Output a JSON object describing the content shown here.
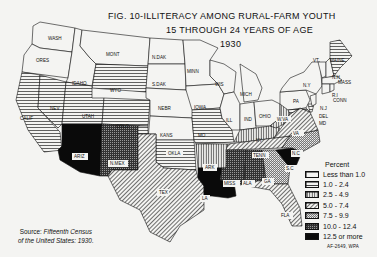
{
  "title": {
    "line1": "FIG. 10-ILLITERACY AMONG RURAL-FARM YOUTH",
    "line2": "15 THROUGH 24 YEARS OF AGE",
    "line3": "1930"
  },
  "legend": {
    "header": "Percent",
    "items": [
      {
        "label": "Less than 1.0",
        "pattern": "blank"
      },
      {
        "label": "1.0 - 2.4",
        "pattern": "horizontal"
      },
      {
        "label": "2.5 - 4.9",
        "pattern": "vertical"
      },
      {
        "label": "5.0 - 7.4",
        "pattern": "diagonal"
      },
      {
        "label": "7.5 - 9.9",
        "pattern": "crosshatch-light"
      },
      {
        "label": "10.0 - 12.4",
        "pattern": "crosshatch-dark"
      },
      {
        "label": "12.5 or more",
        "pattern": "solid"
      }
    ]
  },
  "source": {
    "prefix": "Source:",
    "text1": "Fifteenth Census",
    "text2": "of the United States: 1930."
  },
  "code": "AF-2649, WPA",
  "states": [
    {
      "abbr": "WASH",
      "class": "Less than 1.0"
    },
    {
      "abbr": "ORES",
      "class": "Less than 1.0"
    },
    {
      "abbr": "IDAHO",
      "class": "Less than 1.0"
    },
    {
      "abbr": "MONT",
      "class": "Less than 1.0"
    },
    {
      "abbr": "WYO",
      "class": "1.0 - 2.4"
    },
    {
      "abbr": "CALIF",
      "class": "1.0 - 2.4"
    },
    {
      "abbr": "NEV",
      "class": "1.0 - 2.4"
    },
    {
      "abbr": "UTAH",
      "class": "1.0 - 2.4"
    },
    {
      "abbr": "COLO",
      "class": "1.0 - 2.4"
    },
    {
      "abbr": "ARIZ",
      "class": "12.5 or more"
    },
    {
      "abbr": "N.MEX",
      "class": "10.0 - 12.4"
    },
    {
      "abbr": "N.DAK",
      "class": "Less than 1.0"
    },
    {
      "abbr": "S.DAK",
      "class": "Less than 1.0"
    },
    {
      "abbr": "NEBR",
      "class": "Less than 1.0"
    },
    {
      "abbr": "KANS",
      "class": "Less than 1.0"
    },
    {
      "abbr": "OKLA",
      "class": "1.0 - 2.4"
    },
    {
      "abbr": "TEX",
      "class": "5.0 - 7.4"
    },
    {
      "abbr": "MINN",
      "class": "Less than 1.0"
    },
    {
      "abbr": "IOWA",
      "class": "Less than 1.0"
    },
    {
      "abbr": "MO",
      "class": "1.0 - 2.4"
    },
    {
      "abbr": "ARK",
      "class": "2.5 - 4.9"
    },
    {
      "abbr": "LA",
      "class": "12.5 or more"
    },
    {
      "abbr": "WIS",
      "class": "Less than 1.0"
    },
    {
      "abbr": "ILL",
      "class": "Less than 1.0"
    },
    {
      "abbr": "MICH",
      "class": "Less than 1.0"
    },
    {
      "abbr": "IND",
      "class": "Less than 1.0"
    },
    {
      "abbr": "OHIO",
      "class": "Less than 1.0"
    },
    {
      "abbr": "KY",
      "class": "2.5 - 4.9"
    },
    {
      "abbr": "TENN",
      "class": "5.0 - 7.4"
    },
    {
      "abbr": "MISS",
      "class": "10.0 - 12.4"
    },
    {
      "abbr": "ALA",
      "class": "10.0 - 12.4"
    },
    {
      "abbr": "GA",
      "class": "7.5 - 9.9"
    },
    {
      "abbr": "FLA",
      "class": "5.0 - 7.4"
    },
    {
      "abbr": "S.C",
      "class": "12.5 or more"
    },
    {
      "abbr": "N.C",
      "class": "7.5 - 9.9"
    },
    {
      "abbr": "VA",
      "class": "5.0 - 7.4"
    },
    {
      "abbr": "W.VA",
      "class": "2.5 - 4.9"
    },
    {
      "abbr": "PA",
      "class": "Less than 1.0"
    },
    {
      "abbr": "N.Y",
      "class": "Less than 1.0"
    },
    {
      "abbr": "VT",
      "class": "Less than 1.0"
    },
    {
      "abbr": "N.H",
      "class": "Less than 1.0"
    },
    {
      "abbr": "MAINE",
      "class": "1.0 - 2.4"
    },
    {
      "abbr": "MASS",
      "class": "Less than 1.0"
    },
    {
      "abbr": "R.I",
      "class": "Less than 1.0"
    },
    {
      "abbr": "CONN",
      "class": "Less than 1.0"
    },
    {
      "abbr": "N.J",
      "class": "Less than 1.0"
    },
    {
      "abbr": "DEL",
      "class": "1.0 - 2.4"
    },
    {
      "abbr": "MD",
      "class": "1.0 - 2.4"
    }
  ]
}
